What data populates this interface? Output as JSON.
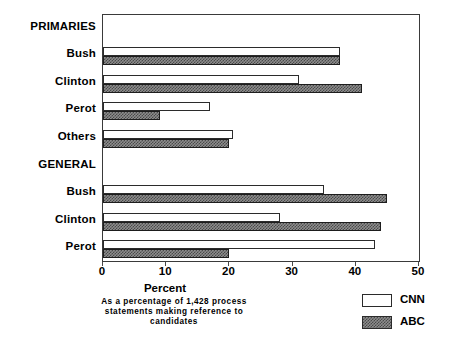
{
  "chart_data": {
    "type": "bar",
    "orientation": "horizontal",
    "title": "",
    "xlabel": "Percent",
    "ylabel": "",
    "xlim": [
      0,
      50
    ],
    "xticks": [
      0,
      10,
      20,
      30,
      40,
      50
    ],
    "xtick_labels": [
      "0",
      "10",
      "20",
      "30",
      "40",
      "50"
    ],
    "grid": false,
    "legend_position": "bottom-right",
    "footnote": [
      "As a percentage of 1,428 process",
      "statements making reference to",
      "candidates"
    ],
    "groups": [
      {
        "name": "PRIMARIES",
        "categories": [
          "Bush",
          "Clinton",
          "Perot",
          "Others"
        ]
      },
      {
        "name": "GENERAL",
        "categories": [
          "Bush",
          "Clinton",
          "Perot"
        ]
      }
    ],
    "categories": [
      "PRIMARIES",
      "Bush",
      "Clinton",
      "Perot",
      "Others",
      "GENERAL",
      "Bush",
      "Clinton",
      "Perot"
    ],
    "series": [
      {
        "name": "CNN",
        "color": "#ffffff",
        "values": [
          null,
          37.5,
          31.0,
          17.0,
          20.5,
          null,
          35.0,
          28.0,
          43.0
        ]
      },
      {
        "name": "ABC",
        "color": "#8d8d8d",
        "values": [
          null,
          37.5,
          41.0,
          9.0,
          20.0,
          null,
          45.0,
          44.0,
          20.0
        ]
      }
    ],
    "rows": [
      {
        "group": "PRIMARIES",
        "label": "PRIMARIES",
        "is_group_header": true,
        "cnn": null,
        "abc": null
      },
      {
        "group": "PRIMARIES",
        "label": "Bush",
        "is_group_header": false,
        "cnn": 37.5,
        "abc": 37.5
      },
      {
        "group": "PRIMARIES",
        "label": "Clinton",
        "is_group_header": false,
        "cnn": 31.0,
        "abc": 41.0
      },
      {
        "group": "PRIMARIES",
        "label": "Perot",
        "is_group_header": false,
        "cnn": 17.0,
        "abc": 9.0
      },
      {
        "group": "PRIMARIES",
        "label": "Others",
        "is_group_header": false,
        "cnn": 20.5,
        "abc": 20.0
      },
      {
        "group": "GENERAL",
        "label": "GENERAL",
        "is_group_header": true,
        "cnn": null,
        "abc": null
      },
      {
        "group": "GENERAL",
        "label": "Bush",
        "is_group_header": false,
        "cnn": 35.0,
        "abc": 45.0
      },
      {
        "group": "GENERAL",
        "label": "Clinton",
        "is_group_header": false,
        "cnn": 28.0,
        "abc": 44.0
      },
      {
        "group": "GENERAL",
        "label": "Perot",
        "is_group_header": false,
        "cnn": 43.0,
        "abc": 20.0
      }
    ],
    "legend": [
      {
        "label": "CNN",
        "swatch": "white"
      },
      {
        "label": "ABC",
        "swatch": "hatched"
      }
    ]
  }
}
